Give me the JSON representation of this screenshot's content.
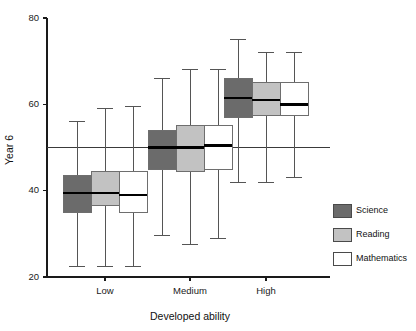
{
  "chart_data": {
    "type": "box",
    "title": "",
    "xlabel": "Developed ability",
    "ylabel": "Year 6",
    "categories": [
      "Low",
      "Medium",
      "High"
    ],
    "ylim": [
      20,
      80
    ],
    "yticks": [
      20,
      40,
      60,
      80
    ],
    "ytick_labels": [
      "20",
      "40",
      "60",
      "80"
    ],
    "grid": false,
    "legend_position": "right",
    "reference_line": 50,
    "series": [
      {
        "name": "Science",
        "color": "#6b6b6b",
        "boxes": [
          {
            "category": "Low",
            "whisker_low": 22.5,
            "q1": 35.0,
            "median": 39.5,
            "q3": 43.5,
            "whisker_high": 56.0
          },
          {
            "category": "Medium",
            "whisker_low": 29.5,
            "q1": 45.0,
            "median": 50.0,
            "q3": 54.0,
            "whisker_high": 66.0
          },
          {
            "category": "High",
            "whisker_low": 42.0,
            "q1": 57.0,
            "median": 61.5,
            "q3": 66.0,
            "whisker_high": 75.0
          }
        ]
      },
      {
        "name": "Reading",
        "color": "#c2c2c2",
        "boxes": [
          {
            "category": "Low",
            "whisker_low": 22.5,
            "q1": 36.5,
            "median": 39.5,
            "q3": 44.5,
            "whisker_high": 59.0
          },
          {
            "category": "Medium",
            "whisker_low": 27.5,
            "q1": 44.5,
            "median": 50.0,
            "q3": 55.0,
            "whisker_high": 68.0
          },
          {
            "category": "High",
            "whisker_low": 42.0,
            "q1": 57.5,
            "median": 61.0,
            "q3": 65.0,
            "whisker_high": 72.0
          }
        ]
      },
      {
        "name": "Mathematics",
        "color": "#ffffff",
        "boxes": [
          {
            "category": "Low",
            "whisker_low": 22.5,
            "q1": 35.0,
            "median": 39.0,
            "q3": 44.5,
            "whisker_high": 59.5
          },
          {
            "category": "Medium",
            "whisker_low": 29.0,
            "q1": 45.0,
            "median": 50.5,
            "q3": 55.0,
            "whisker_high": 68.0
          },
          {
            "category": "High",
            "whisker_low": 43.0,
            "q1": 57.5,
            "median": 60.0,
            "q3": 65.0,
            "whisker_high": 72.0
          }
        ]
      }
    ],
    "legend": [
      {
        "label": "Science",
        "color": "#6b6b6b"
      },
      {
        "label": "Reading",
        "color": "#c2c2c2"
      },
      {
        "label": "Mathematics",
        "color": "#ffffff"
      }
    ]
  },
  "colors": {
    "axis": "#1a1a1a",
    "reference_line": "#3a3a3a",
    "whisker": "#555555",
    "box_border": "#6e6e6e",
    "median": "#000000",
    "background": "#ffffff"
  }
}
